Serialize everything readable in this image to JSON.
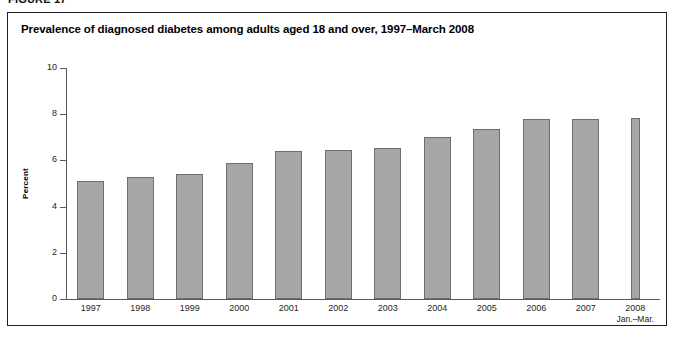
{
  "figure": {
    "label": "FIGURE 17",
    "title": "Prevalence of diagnosed diabetes among adults aged 18 and over, 1997–March 2008"
  },
  "chart_data": {
    "type": "bar",
    "title": "Prevalence of diagnosed diabetes among adults aged 18 and over, 1997–March 2008",
    "xlabel": "",
    "ylabel": "Percent",
    "ylim": [
      0,
      10
    ],
    "yticks": [
      0,
      2,
      4,
      6,
      8,
      10
    ],
    "ytick_labels": [
      "0",
      "2",
      "4",
      "6",
      "8",
      "10"
    ],
    "grid": false,
    "legend": null,
    "categories": [
      "1997",
      "1998",
      "1999",
      "2000",
      "2001",
      "2002",
      "2003",
      "2004",
      "2005",
      "2006",
      "2007",
      "2008"
    ],
    "category_sublabels": [
      "",
      "",
      "",
      "",
      "",
      "",
      "",
      "",
      "",
      "",
      "",
      "Jan.–Mar."
    ],
    "values": [
      5.1,
      5.3,
      5.4,
      5.9,
      6.4,
      6.45,
      6.55,
      7.0,
      7.35,
      7.8,
      7.8,
      7.85
    ],
    "bar_color": "#a6a6a6",
    "bar_border_color": "#6d6e70",
    "axis_color": "#58595b",
    "last_bar_narrow": true
  }
}
